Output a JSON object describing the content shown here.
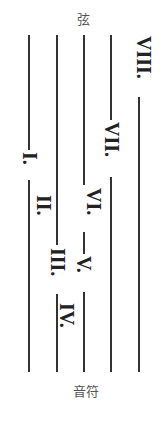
{
  "diagram": {
    "top_caption": "弦",
    "bottom_caption": "音符",
    "line_color": "#333333",
    "strings": [
      {
        "index": 1,
        "x": 28
      },
      {
        "index": 2,
        "x": 56
      },
      {
        "index": 3,
        "x": 83
      },
      {
        "index": 4,
        "x": 110
      },
      {
        "index": 5,
        "x": 138
      }
    ],
    "labels": [
      {
        "text": "I.",
        "x": 28,
        "y": 152
      },
      {
        "text": "II.",
        "x": 42,
        "y": 195
      },
      {
        "text": "III.",
        "x": 58,
        "y": 248
      },
      {
        "text": "IV.",
        "x": 67,
        "y": 303
      },
      {
        "text": "V.",
        "x": 85,
        "y": 256
      },
      {
        "text": "VI.",
        "x": 95,
        "y": 188
      },
      {
        "text": "VII.",
        "x": 112,
        "y": 122
      },
      {
        "text": "VIII.",
        "x": 143,
        "y": 36
      }
    ]
  }
}
